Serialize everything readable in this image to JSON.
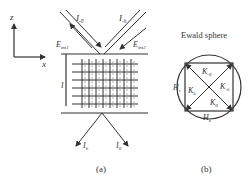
{
  "panel_a": {
    "axes": {
      "z_label": "z",
      "x_label": "x"
    },
    "incident_beams": [
      {
        "label": "I",
        "sub": "-0"
      },
      {
        "label": "I",
        "sub": "-h"
      }
    ],
    "field_labels": [
      {
        "label": "E",
        "sub": "int1"
      },
      {
        "label": "E",
        "sub": "int2"
      }
    ],
    "thickness_label": "l",
    "exit_beams": [
      {
        "label": "I",
        "sub": "h"
      },
      {
        "label": "I",
        "sub": "0"
      }
    ],
    "caption": "(a)"
  },
  "panel_b": {
    "title": "Ewald sphere",
    "vectors": [
      {
        "label": "K",
        "sub": "-0"
      },
      {
        "label": "K",
        "sub": "-h"
      },
      {
        "label": "K",
        "sub": "h"
      },
      {
        "label": "K",
        "sub": "0"
      }
    ],
    "h_labels": [
      {
        "label": "H",
        "sub": "z"
      },
      {
        "label": "H",
        "sub": "x"
      }
    ],
    "caption": "(b)"
  }
}
